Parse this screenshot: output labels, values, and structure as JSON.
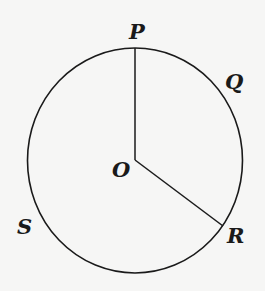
{
  "diagram": {
    "type": "circle-geometry",
    "background": "#f6f6f5",
    "stroke_color": "#1a1a1a",
    "circle": {
      "center_label": "O",
      "cx": 135,
      "cy": 160,
      "rx": 108,
      "ry": 112
    },
    "radii": [
      {
        "from": "O",
        "to": "P",
        "x2": 135,
        "y2": 48
      },
      {
        "from": "O",
        "to": "R",
        "x2": 223,
        "y2": 225
      }
    ],
    "points": [
      {
        "name": "P",
        "label": "P",
        "x": 129,
        "y": 39
      },
      {
        "name": "Q",
        "label": "Q",
        "x": 226,
        "y": 88
      },
      {
        "name": "R",
        "label": "R",
        "x": 228,
        "y": 242
      },
      {
        "name": "S",
        "label": "S",
        "x": 18,
        "y": 233
      },
      {
        "name": "O",
        "label": "O",
        "x": 112,
        "y": 175
      }
    ]
  }
}
